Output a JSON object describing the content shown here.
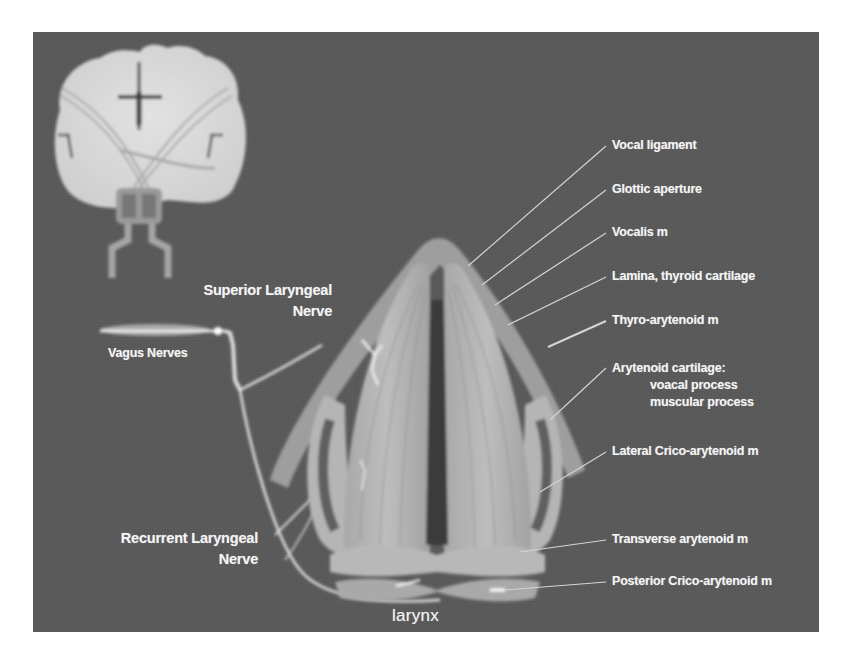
{
  "figure": {
    "background_color": "#595959",
    "label_color": "#f4f4f4",
    "line_color": "#d8d8d8",
    "inset": {
      "name": "brain coronal section",
      "description": "Coronal brain section with descending tracts to brainstem"
    },
    "left_labels": {
      "superior_laryngeal_nerve": [
        "Superior Laryngeal",
        "Nerve"
      ],
      "vagus_nerves": "Vagus Nerves",
      "recurrent_laryngeal_nerve": [
        "Recurrent Laryngeal",
        "Nerve"
      ]
    },
    "center_label": "larynx",
    "right_labels": [
      {
        "id": "vocal-ligament",
        "text": "Vocal ligament"
      },
      {
        "id": "glottic-aperture",
        "text": "Glottic aperture"
      },
      {
        "id": "vocalis",
        "text": "Vocalis m"
      },
      {
        "id": "lamina-thyroid-cartilage",
        "text": "Lamina, thyroid cartilage"
      },
      {
        "id": "thyro-arytenoid",
        "text": "Thyro-arytenoid m"
      },
      {
        "id": "arytenoid-cartilage",
        "text": "Arytenoid cartilage:",
        "sub": [
          "voacal process",
          "muscular process"
        ]
      },
      {
        "id": "lateral-crico-arytenoid",
        "text": "Lateral Crico-arytenoid m"
      },
      {
        "id": "transverse-arytenoid",
        "text": "Transverse arytenoid m"
      },
      {
        "id": "posterior-crico-arytenoid",
        "text": "Posterior Crico-arytenoid m"
      }
    ]
  }
}
